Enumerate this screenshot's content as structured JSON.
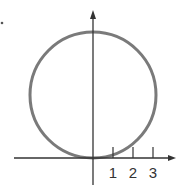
{
  "diagram": {
    "type": "circle-on-axes",
    "x_axis": {
      "tick_labels": [
        "1",
        "2",
        "3"
      ]
    },
    "y_axis": {},
    "colors": {
      "circle": "#777777",
      "axes": "#333333",
      "text": "#333333"
    }
  }
}
